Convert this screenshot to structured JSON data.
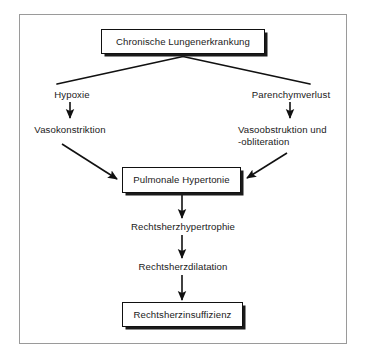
{
  "diagram": {
    "title_node": {
      "id": "chronische-lungenerkrankung",
      "label": "Chronische Lungenerkrankung",
      "boxed": true
    },
    "nodes": [
      {
        "id": "chronische-lungenerkrankung",
        "label": "Chronische Lungenerkrankung",
        "boxed": true
      },
      {
        "id": "hypoxie",
        "label": "Hypoxie",
        "boxed": false
      },
      {
        "id": "parenchymverlust",
        "label": "Parenchymverlust",
        "boxed": false
      },
      {
        "id": "vasokonstriktion",
        "label": "Vasokonstriktion",
        "boxed": false
      },
      {
        "id": "vasoobstruktion",
        "label": "Vasoobstruktion und",
        "label_line2": "-obliteration",
        "boxed": false
      },
      {
        "id": "pulmonale-hypertonie",
        "label": "Pulmonale Hypertonie",
        "boxed": true
      },
      {
        "id": "rechtsherzhypertrophie",
        "label": "Rechtsherzhypertrophie",
        "boxed": false
      },
      {
        "id": "rechtsherzdilatation",
        "label": "Rechtsherzdilatation",
        "boxed": false
      },
      {
        "id": "rechtsherzinsuffizienz",
        "label": "Rechtsherzinsuffizienz",
        "boxed": true
      }
    ],
    "edges": [
      {
        "from": "chronische-lungenerkrankung",
        "to": "hypoxie",
        "style": "line-no-arrow"
      },
      {
        "from": "chronische-lungenerkrankung",
        "to": "parenchymverlust",
        "style": "line-no-arrow"
      },
      {
        "from": "hypoxie",
        "to": "vasokonstriktion",
        "style": "arrow-vertical"
      },
      {
        "from": "parenchymverlust",
        "to": "vasoobstruktion",
        "style": "arrow-vertical"
      },
      {
        "from": "vasokonstriktion",
        "to": "pulmonale-hypertonie",
        "style": "arrow-diagonal"
      },
      {
        "from": "vasoobstruktion",
        "to": "pulmonale-hypertonie",
        "style": "arrow-diagonal"
      },
      {
        "from": "pulmonale-hypertonie",
        "to": "rechtsherzhypertrophie",
        "style": "arrow-vertical"
      },
      {
        "from": "rechtsherzhypertrophie",
        "to": "rechtsherzdilatation",
        "style": "arrow-vertical"
      },
      {
        "from": "rechtsherzdilatation",
        "to": "rechtsherzinsuffizienz",
        "style": "arrow-vertical"
      }
    ],
    "colors": {
      "frame_border": "#9a9a9a",
      "box_border": "#111111",
      "box_shadow": "#1a1a1a",
      "connector": "#111111",
      "text": "#1a1a1a",
      "background": "#ffffff"
    }
  }
}
